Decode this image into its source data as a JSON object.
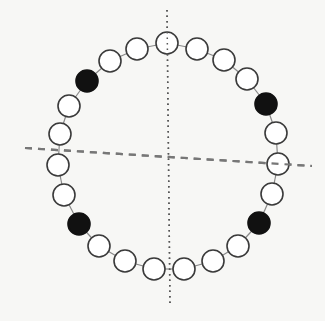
{
  "diagram": {
    "colors": {
      "background": "#f7f7f5",
      "bead_stroke": "#3a3a3a",
      "bead_open_fill": "#ffffff",
      "bead_filled_fill": "#111111",
      "connector": "#888888",
      "dotted_axis": "#555555",
      "dashed_axis": "#777777"
    },
    "bead_radius": 11,
    "beads": [
      {
        "x": 167,
        "y": 43,
        "filled": false
      },
      {
        "x": 197,
        "y": 49,
        "filled": false
      },
      {
        "x": 224,
        "y": 60,
        "filled": false
      },
      {
        "x": 247,
        "y": 79,
        "filled": false
      },
      {
        "x": 266,
        "y": 104,
        "filled": true
      },
      {
        "x": 276,
        "y": 133,
        "filled": false
      },
      {
        "x": 278,
        "y": 164,
        "filled": false
      },
      {
        "x": 272,
        "y": 194,
        "filled": false
      },
      {
        "x": 259,
        "y": 223,
        "filled": true
      },
      {
        "x": 238,
        "y": 246,
        "filled": false
      },
      {
        "x": 213,
        "y": 261,
        "filled": false
      },
      {
        "x": 184,
        "y": 269,
        "filled": false
      },
      {
        "x": 154,
        "y": 269,
        "filled": false
      },
      {
        "x": 125,
        "y": 261,
        "filled": false
      },
      {
        "x": 99,
        "y": 246,
        "filled": false
      },
      {
        "x": 79,
        "y": 224,
        "filled": true
      },
      {
        "x": 64,
        "y": 195,
        "filled": false
      },
      {
        "x": 58,
        "y": 165,
        "filled": false
      },
      {
        "x": 60,
        "y": 134,
        "filled": false
      },
      {
        "x": 69,
        "y": 106,
        "filled": false
      },
      {
        "x": 87,
        "y": 81,
        "filled": true
      },
      {
        "x": 110,
        "y": 61,
        "filled": false
      },
      {
        "x": 137,
        "y": 49,
        "filled": false
      }
    ],
    "dotted_axis": {
      "x1": 167,
      "y1": 10,
      "x2": 170,
      "y2": 306
    },
    "dashed_axis": {
      "x1": 25,
      "y1": 148,
      "x2": 312,
      "y2": 166
    }
  }
}
